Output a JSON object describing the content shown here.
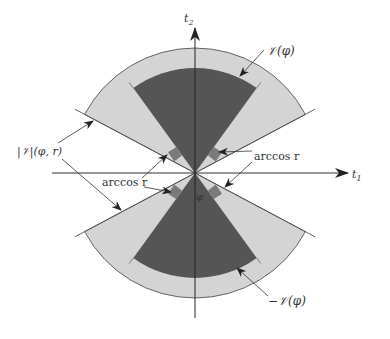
{
  "diagram": {
    "type": "double-cone sector diagram",
    "axes": {
      "horizontal": {
        "label": "t",
        "subscript": "1"
      },
      "vertical": {
        "label": "t",
        "subscript": "2"
      }
    },
    "regions": {
      "upper_cone": {
        "label": "𝒱(φ)",
        "fill": "#555555"
      },
      "lower_cone": {
        "label": "−𝒱(φ)",
        "fill": "#555555"
      },
      "neighborhood": {
        "label": "|𝒱|(φ, r)",
        "fill": "#d4d4d4"
      },
      "margin_marker": {
        "fill": "#7a7a7a"
      }
    },
    "annotations": {
      "arccos_right": "arccos r",
      "arccos_left": "arccos r",
      "phi": "φ"
    },
    "colors": {
      "background": "#ffffff",
      "stroke": "#333333",
      "dark_fill": "#555555",
      "light_fill": "#d4d4d4",
      "marker_fill": "#7a7a7a"
    }
  }
}
